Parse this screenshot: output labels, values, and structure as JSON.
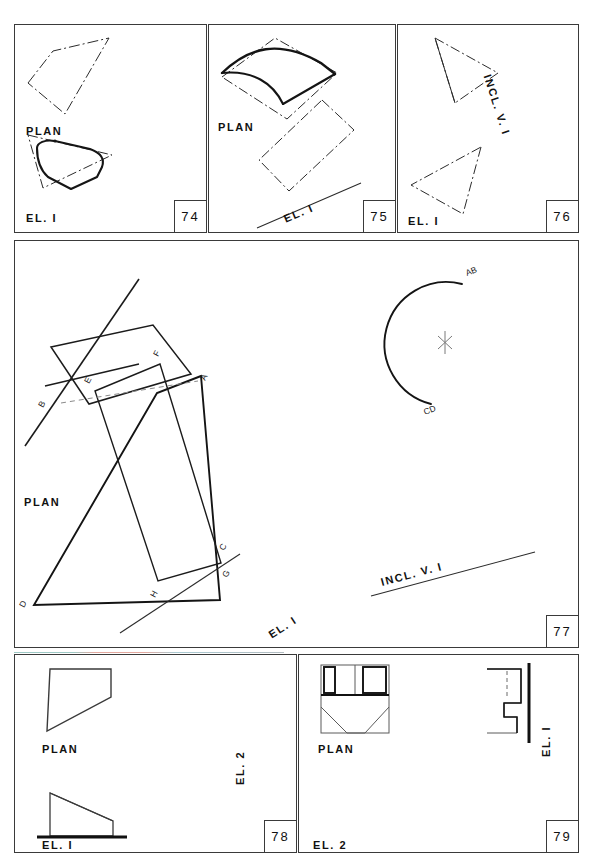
{
  "page": {
    "width": 590,
    "height": 853,
    "background": "#ffffff",
    "ink": "#1a1a1a",
    "border": "#3a3a3a",
    "sheet_kind": "descriptive-geometry-exercise-sheet"
  },
  "panels": [
    {
      "id": "panel-74",
      "number": "74",
      "labels": [
        {
          "name": "plan-label",
          "text": "PLAN"
        },
        {
          "name": "el1-label",
          "text": "EL. I"
        }
      ],
      "figures": [
        {
          "name": "plan-quadrilateral-dashdot",
          "style": "dash-dot",
          "role": "plan-outline"
        },
        {
          "name": "el1-closed-curve-solid",
          "style": "solid-thick",
          "role": "elevation-true-shape"
        },
        {
          "name": "el1-triangle-dashdot",
          "style": "dash-dot",
          "role": "elevation-outline"
        }
      ]
    },
    {
      "id": "panel-75",
      "number": "75",
      "labels": [
        {
          "name": "plan-label",
          "text": "PLAN"
        },
        {
          "name": "el1-label",
          "text": "EL. I"
        }
      ],
      "figures": [
        {
          "name": "plan-parallelogram-dashdot",
          "style": "dash-dot",
          "role": "plan-outline"
        },
        {
          "name": "plan-curved-vault-solid",
          "style": "solid-thick",
          "role": "curved-surface"
        },
        {
          "name": "el1-rectangle-dashdot",
          "style": "dash-dot",
          "role": "elevation-outline"
        },
        {
          "name": "el1-ground-line",
          "style": "solid-thin",
          "role": "ground-line"
        }
      ]
    },
    {
      "id": "panel-76",
      "number": "76",
      "labels": [
        {
          "name": "incl-v1-label",
          "text": "INCL. V. I"
        },
        {
          "name": "el1-label",
          "text": "EL. I"
        }
      ],
      "figures": [
        {
          "name": "incl-v1-triangle-dashdot",
          "style": "dash-dot",
          "role": "inclined-view-outline"
        },
        {
          "name": "el1-triangle-dashdot",
          "style": "dash-dot",
          "role": "elevation-outline"
        }
      ]
    },
    {
      "id": "panel-77",
      "number": "77",
      "labels": [
        {
          "name": "plan-label",
          "text": "PLAN"
        },
        {
          "name": "el1-label",
          "text": "EL. I"
        },
        {
          "name": "incl-v1-label",
          "text": "INCL. V. I"
        }
      ],
      "vertex_labels": [
        "A",
        "B",
        "C",
        "D",
        "E",
        "F",
        "G",
        "H"
      ],
      "arc_labels": [
        "AB",
        "CD"
      ],
      "figures": [
        {
          "name": "plan-parallelogram-solid",
          "style": "solid",
          "role": "plan-outline"
        },
        {
          "name": "plan-intersecting-line",
          "style": "solid",
          "role": "intersection-line"
        },
        {
          "name": "plan-short-trace-line",
          "style": "solid",
          "role": "trace-line"
        },
        {
          "name": "el1-trapezoid-abdc",
          "style": "solid-thick",
          "role": "elevation-plane-1"
        },
        {
          "name": "el1-quadrilateral-efgh",
          "style": "solid",
          "role": "elevation-plane-2"
        },
        {
          "name": "el1-intersection-dashed",
          "style": "dashed",
          "role": "hidden-intersection"
        },
        {
          "name": "el1-ground-line",
          "style": "solid-thin",
          "role": "ground-line"
        },
        {
          "name": "dihedral-angle-arc",
          "style": "solid-thick",
          "role": "angle-arc-ab-cd"
        },
        {
          "name": "center-cross-mark",
          "style": "thin-cross",
          "role": "center-mark"
        },
        {
          "name": "incl-v1-ground-line",
          "style": "solid-thin",
          "role": "ground-line"
        }
      ]
    },
    {
      "id": "panel-78",
      "number": "78",
      "labels": [
        {
          "name": "plan-label",
          "text": "PLAN"
        },
        {
          "name": "el1-label",
          "text": "EL. I"
        },
        {
          "name": "el2-label",
          "text": "EL. 2"
        }
      ],
      "figures": [
        {
          "name": "plan-trapezoid",
          "style": "solid",
          "role": "plan-outline"
        },
        {
          "name": "el1-right-triangle",
          "style": "solid",
          "role": "elevation-outline"
        },
        {
          "name": "el1-ground-line-thick",
          "style": "solid-thick",
          "role": "ground-line"
        }
      ]
    },
    {
      "id": "panel-79",
      "number": "79",
      "labels": [
        {
          "name": "plan-label",
          "text": "PLAN"
        },
        {
          "name": "el1-label",
          "text": "EL. I"
        },
        {
          "name": "el2-label",
          "text": "EL. 2"
        }
      ],
      "figures": [
        {
          "name": "plan-slot-block",
          "style": "solid-mixed",
          "role": "plan-outline"
        },
        {
          "name": "plan-chamfer-v",
          "style": "solid-thin",
          "role": "chamfer"
        },
        {
          "name": "el1-stepped-profile",
          "style": "solid",
          "role": "elevation-outline"
        },
        {
          "name": "el1-hidden-line",
          "style": "dashed",
          "role": "hidden-edge"
        },
        {
          "name": "el1-reference-plane-thick",
          "style": "solid-thick",
          "role": "picture-plane"
        }
      ]
    }
  ]
}
